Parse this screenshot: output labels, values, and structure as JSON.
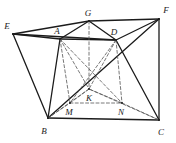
{
  "figure": {
    "kind": "geometry-diagram",
    "width": 176,
    "height": 143,
    "background_color": "#ffffff",
    "stroke_color": "#1b1b1b",
    "dashed_stroke_color": "#555555",
    "points": [
      {
        "id": "E",
        "label": "E",
        "x": 13,
        "y": 34,
        "label_x": 7,
        "label_y": 26
      },
      {
        "id": "G",
        "label": "G",
        "x": 89,
        "y": 21,
        "label_x": 88,
        "label_y": 13
      },
      {
        "id": "F",
        "label": "F",
        "x": 159,
        "y": 19,
        "label_x": 166,
        "label_y": 10
      },
      {
        "id": "A",
        "label": "A",
        "x": 60,
        "y": 39,
        "label_x": 57,
        "label_y": 31
      },
      {
        "id": "D",
        "label": "D",
        "x": 116,
        "y": 40,
        "label_x": 114,
        "label_y": 32
      },
      {
        "id": "K",
        "label": "K",
        "x": 89,
        "y": 89,
        "label_x": 89,
        "label_y": 98
      },
      {
        "id": "M",
        "label": "M",
        "x": 70,
        "y": 103,
        "label_x": 69,
        "label_y": 112
      },
      {
        "id": "N",
        "label": "N",
        "x": 122,
        "y": 103,
        "label_x": 121,
        "label_y": 112
      },
      {
        "id": "B",
        "label": "B",
        "x": 48,
        "y": 118,
        "label_x": 44,
        "label_y": 131
      },
      {
        "id": "C",
        "label": "C",
        "x": 159,
        "y": 120,
        "label_x": 161,
        "label_y": 132
      }
    ],
    "solid_edges": [
      {
        "from": "E",
        "to": "G"
      },
      {
        "from": "G",
        "to": "F"
      },
      {
        "from": "E",
        "to": "A"
      },
      {
        "from": "A",
        "to": "G"
      },
      {
        "from": "G",
        "to": "D"
      },
      {
        "from": "D",
        "to": "F"
      },
      {
        "from": "A",
        "to": "D"
      },
      {
        "from": "E",
        "to": "B"
      },
      {
        "from": "E",
        "to": "D"
      },
      {
        "from": "A",
        "to": "B"
      },
      {
        "from": "D",
        "to": "C"
      },
      {
        "from": "B",
        "to": "C"
      },
      {
        "from": "C",
        "to": "F"
      },
      {
        "from": "B",
        "to": "F"
      }
    ],
    "dashed_edges": [
      {
        "from": "A",
        "to": "M"
      },
      {
        "from": "D",
        "to": "N"
      },
      {
        "from": "M",
        "to": "N"
      },
      {
        "from": "A",
        "to": "K"
      },
      {
        "from": "D",
        "to": "K"
      },
      {
        "from": "G",
        "to": "K"
      },
      {
        "from": "M",
        "to": "K"
      },
      {
        "from": "N",
        "to": "K"
      },
      {
        "from": "A",
        "to": "N"
      },
      {
        "from": "D",
        "to": "M"
      },
      {
        "from": "B",
        "to": "K"
      },
      {
        "from": "C",
        "to": "K"
      },
      {
        "from": "B",
        "to": "M"
      },
      {
        "from": "N",
        "to": "C"
      }
    ]
  }
}
